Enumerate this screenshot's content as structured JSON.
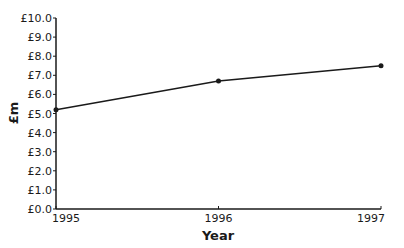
{
  "chart_data": {
    "type": "line",
    "title": "",
    "xlabel": "Year",
    "ylabel": "£m",
    "categories": [
      "1995",
      "1996",
      "1997"
    ],
    "values": [
      5.2,
      6.7,
      7.5
    ],
    "series": [
      {
        "name": "£m",
        "values": [
          5.2,
          6.7,
          7.5
        ]
      }
    ],
    "yticks": [
      "£0.0",
      "£1.0",
      "£2.0",
      "£3.0",
      "£4.0",
      "£5.0",
      "£6.0",
      "£7.0",
      "£8.0",
      "£9.0",
      "£10.0"
    ],
    "ylim": [
      0,
      10
    ],
    "grid": false,
    "legend": "none",
    "colors": {
      "line": "#1a1a1a",
      "axis": "#1a1a1a"
    }
  }
}
